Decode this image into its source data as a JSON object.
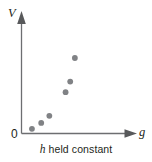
{
  "figure": {
    "caption_variable": "h",
    "caption_text": " held constant",
    "origin_label": "0",
    "background_color": "#ffffff",
    "axis_color": "#6d6e71",
    "text_color": "#231f20",
    "point_color": "#808285"
  },
  "chart_data": {
    "type": "scatter",
    "title": "",
    "subtitle": "h held constant",
    "xlabel": "g",
    "ylabel": "V",
    "grid": false,
    "legend": null,
    "xlim": [
      0,
      1
    ],
    "ylim": [
      0,
      1
    ],
    "tick_labels": {
      "x": [],
      "y": [
        "0"
      ]
    },
    "annotations": [
      "h held constant"
    ],
    "series": [
      {
        "name": "V vs g",
        "marker": "filled-circle",
        "color": "#808285",
        "points": [
          {
            "x": 0.09,
            "y": 0.04
          },
          {
            "x": 0.17,
            "y": 0.09
          },
          {
            "x": 0.24,
            "y": 0.15
          },
          {
            "x": 0.38,
            "y": 0.35
          },
          {
            "x": 0.42,
            "y": 0.44
          },
          {
            "x": 0.46,
            "y": 0.64
          }
        ]
      }
    ]
  }
}
